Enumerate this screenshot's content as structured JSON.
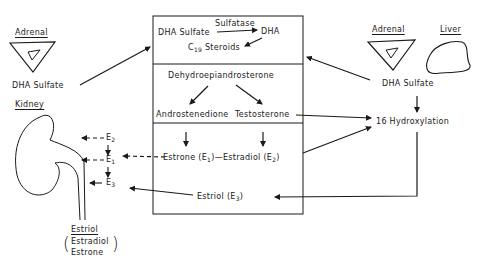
{
  "organs": {
    "left_adrenal": {
      "label": "Adrenal",
      "output": "DHA Sulfate"
    },
    "kidney": {
      "label": "Kidney"
    },
    "right_adrenal": {
      "label": "Adrenal"
    },
    "liver": {
      "label": "Liver"
    },
    "right_output": "DHA Sulfate"
  },
  "placenta_box": {
    "section1": {
      "substrate": "DHA Sulfate",
      "enzyme": "Sulfatase",
      "product": "DHA",
      "c19_prefix": "C",
      "c19_sub": "19",
      "c19_suffix": "Steroids"
    },
    "section2": {
      "precursor": "Dehydroepiandrosterone",
      "left_product": "Androstenedione",
      "right_product": "Testosterone"
    },
    "section3": {
      "estrone": "Estrone (E",
      "estrone_sub": "1",
      "estrone_close": ")",
      "dash": "—",
      "estradiol": "Estradiol (E",
      "estradiol_sub": "2",
      "estradiol_close": ")",
      "estriol": "Estriol  (E",
      "estriol_sub": "3",
      "estriol_close": ")"
    }
  },
  "fetal": {
    "hydroxylation": "16 Hydroxylation"
  },
  "kidney_chain": {
    "e2": "E",
    "e2_sub": "2",
    "e1": "E",
    "e1_sub": "1",
    "e3": "E",
    "e3_sub": "3"
  },
  "urine": {
    "main": "Estriol",
    "paren_line1": "Estradiol",
    "paren_line2": "Estrone",
    "paren_open": "(",
    "paren_close": ")"
  }
}
